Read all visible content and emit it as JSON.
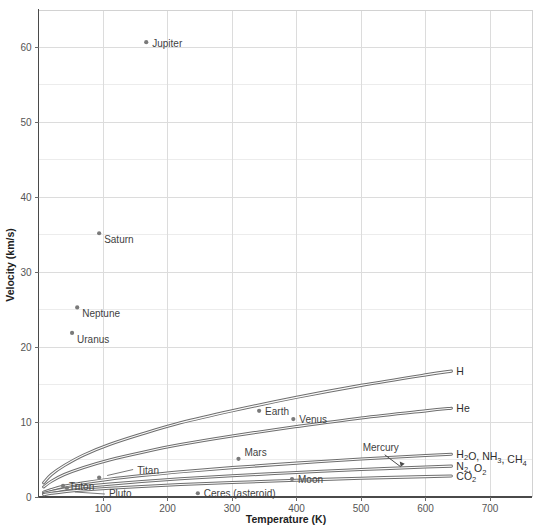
{
  "chart_data": {
    "type": "line",
    "title": "",
    "xlabel": "Temperature (K)",
    "ylabel": "Velocity (km/s)",
    "xlim": [
      0,
      765
    ],
    "ylim": [
      0,
      65
    ],
    "xticks": [
      100,
      200,
      300,
      400,
      500,
      600,
      700
    ],
    "yticks": [
      0,
      10,
      20,
      30,
      40,
      50,
      60
    ],
    "grid": "major gridlines on both axes, light minor gridlines at 5 km/s intervals",
    "legend": "inline curve end labels at right",
    "series": [
      {
        "name": "H2",
        "label": "H",
        "label_sub": "2",
        "x": [
          8,
          20,
          40,
          70,
          110,
          160,
          220,
          300,
          400,
          500,
          600,
          640
        ],
        "y": [
          1.9,
          3.0,
          4.2,
          5.6,
          7.0,
          8.4,
          9.9,
          11.5,
          13.3,
          14.9,
          16.3,
          16.8
        ]
      },
      {
        "name": "He",
        "label": "He",
        "label_sub": "",
        "x": [
          8,
          20,
          40,
          70,
          110,
          160,
          220,
          300,
          400,
          500,
          600,
          640
        ],
        "y": [
          1.35,
          2.1,
          3.0,
          3.95,
          4.95,
          5.95,
          7.0,
          8.15,
          9.4,
          10.55,
          11.5,
          11.85
        ]
      },
      {
        "name": "H2O, NH3, CH4",
        "label": "H₂O, NH₃, CH₄",
        "label_sub": "",
        "x": [
          8,
          20,
          40,
          70,
          110,
          160,
          220,
          300,
          400,
          500,
          600,
          640
        ],
        "y": [
          0.65,
          1.0,
          1.45,
          1.9,
          2.38,
          2.86,
          3.36,
          3.92,
          4.52,
          5.07,
          5.53,
          5.7
        ]
      },
      {
        "name": "N2, O2",
        "label": "N₂, O₂",
        "label_sub": "",
        "x": [
          8,
          20,
          40,
          70,
          110,
          160,
          220,
          300,
          400,
          500,
          600,
          640
        ],
        "y": [
          0.47,
          0.72,
          1.05,
          1.38,
          1.72,
          2.07,
          2.43,
          2.84,
          3.27,
          3.67,
          4.0,
          4.12
        ]
      },
      {
        "name": "CO2",
        "label": "CO₂",
        "label_sub": "",
        "x": [
          8,
          20,
          40,
          70,
          110,
          160,
          220,
          300,
          400,
          500,
          600,
          640
        ],
        "y": [
          0.32,
          0.49,
          0.71,
          0.94,
          1.17,
          1.41,
          1.66,
          1.93,
          2.23,
          2.5,
          2.72,
          2.8
        ]
      }
    ],
    "curve_labels": [
      {
        "name": "H2",
        "text": "H",
        "sub": "2",
        "x": 640,
        "y": 16.8
      },
      {
        "name": "He",
        "text": "He",
        "sub": "",
        "x": 640,
        "y": 11.85
      },
      {
        "name": "H2O-NH3-CH4",
        "text": "H2O, NH3, CH4",
        "sub": "",
        "x": 640,
        "y": 5.7
      },
      {
        "name": "N2-O2",
        "text": "N2, O2",
        "sub": "",
        "x": 640,
        "y": 4.12
      },
      {
        "name": "CO2",
        "text": "CO2",
        "sub": "",
        "x": 640,
        "y": 2.8
      }
    ],
    "points": [
      {
        "name": "Jupiter",
        "label": "Jupiter",
        "x": 167,
        "y": 60.7
      },
      {
        "name": "Saturn",
        "label": "Saturn",
        "x": 94,
        "y": 35.2
      },
      {
        "name": "Neptune",
        "label": "Neptune",
        "x": 60,
        "y": 25.3
      },
      {
        "name": "Uranus",
        "label": "Uranus",
        "x": 52,
        "y": 21.9
      },
      {
        "name": "Earth",
        "label": "Earth",
        "x": 342,
        "y": 11.5
      },
      {
        "name": "Venus",
        "label": "Venus",
        "x": 395,
        "y": 10.4
      },
      {
        "name": "Mars",
        "label": "Mars",
        "x": 310,
        "y": 5.1
      },
      {
        "name": "Mercury",
        "label": "Mercury",
        "x": 577,
        "y": 4.3
      },
      {
        "name": "Moon",
        "label": "Moon",
        "x": 393,
        "y": 2.4
      },
      {
        "name": "Titan",
        "label": "Titan",
        "x": 94,
        "y": 2.6
      },
      {
        "name": "Triton",
        "label": "Triton",
        "x": 38,
        "y": 1.5
      },
      {
        "name": "Pluto",
        "label": "Pluto",
        "x": 44,
        "y": 1.2
      },
      {
        "name": "Ceres (asteroid)",
        "label": "Ceres (asteroid)",
        "x": 247,
        "y": 0.5
      }
    ]
  },
  "axes": {
    "x_title": "Temperature (K)",
    "y_title": "Velocity (km/s)",
    "x_tick_labels": [
      "100",
      "200",
      "300",
      "400",
      "500",
      "600",
      "700"
    ],
    "y_tick_labels": [
      "0",
      "10",
      "20",
      "30",
      "40",
      "50",
      "60"
    ]
  },
  "colors": {
    "curve": "#6e6e6e",
    "point": "#7a7a7a",
    "grid": "#dcdcdc",
    "grid_minor": "#ececec",
    "spine": "#4a4a4a",
    "text": "#3f3f3f",
    "background": "#ffffff"
  }
}
